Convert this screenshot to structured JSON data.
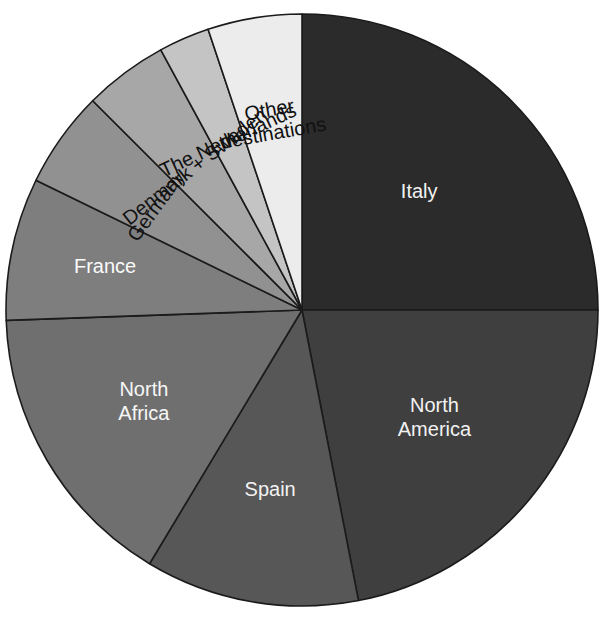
{
  "chart_data": {
    "type": "pie",
    "title": "",
    "subtitle": "",
    "xlabel": "",
    "ylabel": "",
    "legend_position": "none",
    "grid": false,
    "labels_inside_slices": true,
    "start_angle_deg": 0,
    "direction": "clockwise",
    "categories": [
      "Italy",
      "North America",
      "Spain",
      "North Africa",
      "France",
      "Germany",
      "Denmark + Sweden",
      "The Netherlands",
      "Other destinations"
    ],
    "values": [
      25.0,
      21.9,
      11.7,
      15.8,
      7.8,
      5.3,
      4.6,
      2.8,
      5.1
    ],
    "units": "percent",
    "slices": [
      {
        "label": "Italy",
        "label_lines": [
          "Italy"
        ],
        "value": 25.0,
        "start_angle": 0,
        "end_angle": 90,
        "color": "#2b2b2b",
        "label_color": "#f2f2f2",
        "label_rotation": 0,
        "label_radius_frac": 0.56,
        "font_size": 20
      },
      {
        "label": "North America",
        "label_lines": [
          "North",
          "America"
        ],
        "value": 21.9,
        "start_angle": 90,
        "end_angle": 169,
        "color": "#3f3f3f",
        "label_color": "#f2f2f2",
        "label_rotation": 0,
        "label_radius_frac": 0.58,
        "font_size": 20
      },
      {
        "label": "Spain",
        "label_lines": [
          "Spain"
        ],
        "value": 11.7,
        "start_angle": 169,
        "end_angle": 211,
        "color": "#575757",
        "label_color": "#f2f2f2",
        "label_rotation": 0,
        "label_radius_frac": 0.62,
        "font_size": 20
      },
      {
        "label": "North Africa",
        "label_lines": [
          "North",
          "Africa"
        ],
        "value": 15.8,
        "start_angle": 211,
        "end_angle": 268,
        "color": "#6f6f6f",
        "label_color": "#f7f7f7",
        "label_rotation": 0,
        "label_radius_frac": 0.62,
        "font_size": 20
      },
      {
        "label": "France",
        "label_lines": [
          "France"
        ],
        "value": 7.8,
        "start_angle": 268,
        "end_angle": 296,
        "color": "#7e7e7e",
        "label_color": "#fbfbfb",
        "label_rotation": 0,
        "label_radius_frac": 0.68,
        "font_size": 20
      },
      {
        "label": "Germany",
        "label_lines": [
          "Germany"
        ],
        "value": 5.3,
        "start_angle": 296,
        "end_angle": 315,
        "color": "#919191",
        "label_color": "#111111",
        "label_rotation": -54,
        "label_radius_frac": 0.6,
        "font_size": 20
      },
      {
        "label": "Denmark + Sweden",
        "label_lines": [
          "Denmark + Sweden"
        ],
        "value": 4.6,
        "start_angle": 315,
        "end_angle": 331.5,
        "color": "#a7a7a7",
        "label_color": "#111111",
        "label_rotation": -38,
        "label_radius_frac": 0.6,
        "font_size": 20
      },
      {
        "label": "The Netherlands",
        "label_lines": [
          "The Netherlands"
        ],
        "value": 2.8,
        "start_angle": 331.5,
        "end_angle": 341.5,
        "color": "#c4c4c4",
        "label_color": "#111111",
        "label_rotation": -25,
        "label_radius_frac": 0.62,
        "font_size": 20
      },
      {
        "label": "Other destinations",
        "label_lines": [
          "Other",
          "destinations"
        ],
        "value": 5.1,
        "start_angle": 341.5,
        "end_angle": 360,
        "color": "#ececec",
        "label_color": "#111111",
        "label_rotation": -10,
        "label_radius_frac": 0.64,
        "font_size": 20
      }
    ],
    "geometry": {
      "center_x": 302,
      "center_y": 310,
      "radius": 296
    },
    "palette": {
      "stroke": "#1b1b1b",
      "background": "#ffffff"
    }
  }
}
